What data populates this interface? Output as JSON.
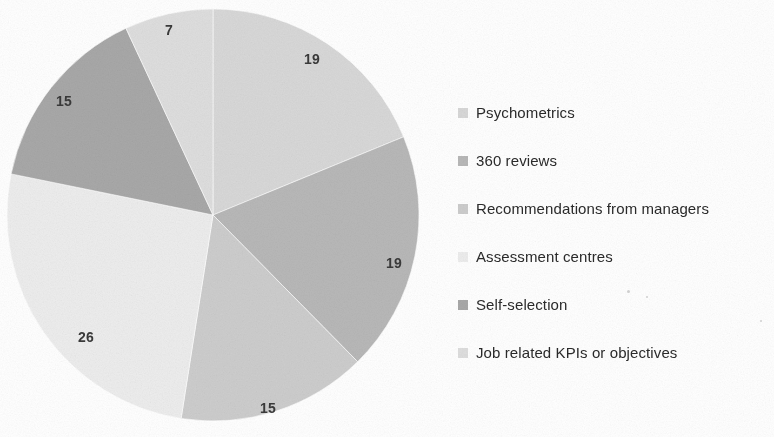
{
  "chart_data": {
    "type": "pie",
    "title": "",
    "subtitle": "",
    "xlabel": "",
    "ylabel": "",
    "legend_position": "right",
    "grid": false,
    "start_angle_deg": 0,
    "direction": "clockwise",
    "categories": [
      "Psychometrics",
      "360 reviews",
      "Recommendations from managers",
      "Assessment centres",
      "Self-selection",
      "Job related KPIs or objectives"
    ],
    "values": [
      19,
      19,
      15,
      26,
      15,
      7
    ],
    "data_labels": [
      "19",
      "19",
      "15",
      "26",
      "15",
      "7"
    ],
    "colors": [
      "#d8d8d8",
      "#b8b8b8",
      "#cdcdcd",
      "#ededed",
      "#a8a8a8",
      "#dedede"
    ],
    "total": 101,
    "slices": [
      {
        "label": "Psychometrics",
        "value": 19,
        "data_label": "19",
        "color": "#d8d8d8",
        "start_deg": 0,
        "end_deg": 67.7,
        "label_x": 312,
        "label_y": 59
      },
      {
        "label": "360 reviews",
        "value": 19,
        "data_label": "19",
        "color": "#b8b8b8",
        "start_deg": 67.7,
        "end_deg": 135.4,
        "label_x": 394,
        "label_y": 263
      },
      {
        "label": "Recommendations from managers",
        "value": 15,
        "data_label": "15",
        "color": "#cdcdcd",
        "start_deg": 135.4,
        "end_deg": 188.9,
        "label_x": 268,
        "label_y": 408
      },
      {
        "label": "Assessment centres",
        "value": 26,
        "data_label": "26",
        "color": "#ededed",
        "start_deg": 188.9,
        "end_deg": 281.5,
        "label_x": 86,
        "label_y": 337
      },
      {
        "label": "Self-selection",
        "value": 15,
        "data_label": "15",
        "color": "#a8a8a8",
        "start_deg": 281.5,
        "end_deg": 335.0,
        "label_x": 64,
        "label_y": 101
      },
      {
        "label": "Job related KPIs or objectives",
        "value": 7,
        "data_label": "7",
        "color": "#dedede",
        "start_deg": 335.0,
        "end_deg": 360,
        "label_x": 169,
        "label_y": 30
      }
    ],
    "geometry": {
      "center_x": 213,
      "center_y": 215,
      "radius": 206
    }
  },
  "legend": {
    "items": [
      {
        "label": "Psychometrics",
        "color": "#d8d8d8"
      },
      {
        "label": "360 reviews",
        "color": "#b8b8b8"
      },
      {
        "label": "Recommendations from managers",
        "color": "#cdcdcd"
      },
      {
        "label": "Assessment centres",
        "color": "#ededed"
      },
      {
        "label": "Self-selection",
        "color": "#a8a8a8"
      },
      {
        "label": "Job related KPIs or objectives",
        "color": "#dedede"
      }
    ]
  }
}
